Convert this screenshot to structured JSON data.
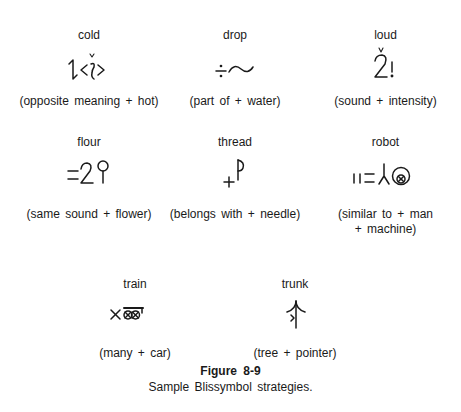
{
  "figure": {
    "number": "Figure 8-9",
    "caption": "Sample Blissymbol strategies."
  },
  "examples": [
    {
      "word": "cold",
      "gloss": "(opposite meaning + hot)",
      "symbol_icon": "cold-blissymbol-icon"
    },
    {
      "word": "drop",
      "gloss": "(part of + water)",
      "symbol_icon": "drop-blissymbol-icon"
    },
    {
      "word": "loud",
      "gloss": "(sound + intensity)",
      "symbol_icon": "loud-blissymbol-icon"
    },
    {
      "word": "flour",
      "gloss": "(same sound + flower)",
      "symbol_icon": "flour-blissymbol-icon"
    },
    {
      "word": "thread",
      "gloss": "(belongs with + needle)",
      "symbol_icon": "thread-blissymbol-icon"
    },
    {
      "word": "robot",
      "gloss_line1": "(similar to + man",
      "gloss_line2": "+ machine)",
      "symbol_icon": "robot-blissymbol-icon"
    },
    {
      "word": "train",
      "gloss": "(many + car)",
      "symbol_icon": "train-blissymbol-icon"
    },
    {
      "word": "trunk",
      "gloss": "(tree + pointer)",
      "symbol_icon": "trunk-blissymbol-icon"
    }
  ]
}
